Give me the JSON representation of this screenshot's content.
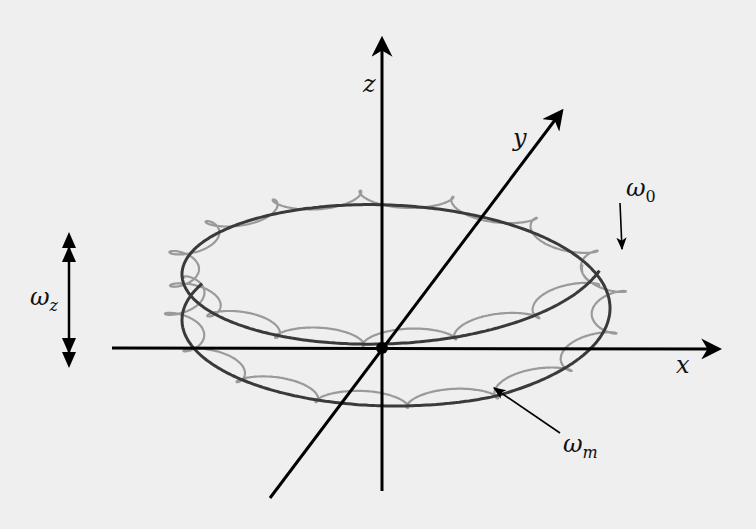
{
  "figure": {
    "background": "#efefef",
    "axis_color": "#000000",
    "guiding_center_color": "#3a3a3a",
    "trajectory_color": "#9a9a9a",
    "origin": {
      "x": 382,
      "y": 348
    },
    "axes": {
      "x": {
        "label": "x",
        "from": [
          112,
          348
        ],
        "to": [
          718,
          349
        ],
        "label_pos": [
          676,
          373
        ]
      },
      "y": {
        "label": "y",
        "from": [
          270,
          498
        ],
        "to": [
          561,
          112
        ],
        "label_pos": [
          513,
          146
        ]
      },
      "z": {
        "label": "z",
        "from": [
          382,
          491
        ],
        "to": [
          382,
          40
        ],
        "label_pos": [
          363,
          92
        ]
      }
    },
    "labels": {
      "omega0": {
        "base": "ω",
        "sub": "0",
        "pos": [
          626,
          196
        ],
        "arrow_from": [
          620,
          203
        ],
        "arrow_to": [
          622,
          249
        ]
      },
      "omegam": {
        "base": "ω",
        "sub": "m",
        "pos": [
          563,
          452
        ],
        "arrow_from": [
          560,
          433
        ],
        "arrow_to": [
          494,
          388
        ]
      },
      "omegaz": {
        "base": "ω",
        "sub": "z",
        "pos": [
          30,
          305
        ]
      }
    },
    "omega_z_arrow": {
      "x": 69,
      "top": 232,
      "bottom": 368
    },
    "spiral": {
      "center_x": 396,
      "rx": 214,
      "ry": 86,
      "top_center_y": 244,
      "bottom_center_y": 320,
      "start_angle_deg": 198,
      "end_angle_deg": 745,
      "loops": 22,
      "loop_r": 17,
      "loop_ry": 8
    }
  }
}
